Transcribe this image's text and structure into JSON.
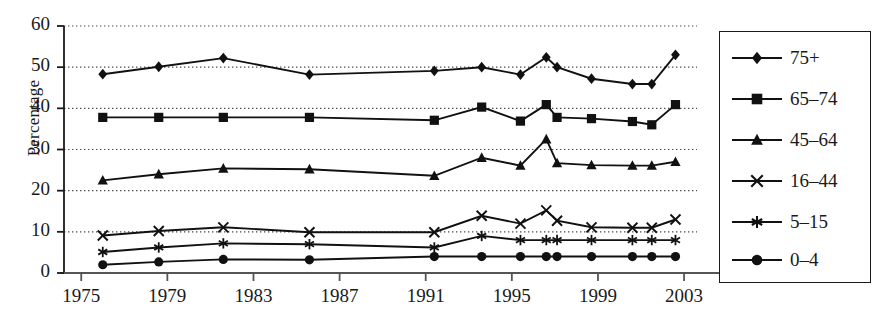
{
  "chart_data": {
    "type": "line",
    "title": "",
    "xlabel": "",
    "ylabel": "Percentage",
    "xlim": [
      1974.2,
      2003.6
    ],
    "ylim": [
      0,
      60
    ],
    "grid": "horizontal-dotted",
    "legend_position": "right-outside",
    "x": [
      1976,
      1978.6,
      1981.6,
      1985.6,
      1991.4,
      1993.6,
      1995.4,
      1996.6,
      1997.1,
      1998.7,
      2000.6,
      2001.5,
      2002.6
    ],
    "xticks": [
      1975,
      1979,
      1983,
      1987,
      1991,
      1995,
      1999,
      2003
    ],
    "xticklabels": [
      "1975",
      "1979",
      "1983",
      "1987",
      "1991",
      "1995",
      "1999",
      "2003"
    ],
    "yticks": [
      0,
      10,
      20,
      30,
      40,
      50,
      60
    ],
    "yticklabels": [
      "0",
      "10",
      "20",
      "30",
      "40",
      "50",
      "60"
    ],
    "series": [
      {
        "name": "75+",
        "marker": "diamond",
        "color": "#111111",
        "values": [
          48.3,
          50.1,
          52.2,
          48.2,
          49.1,
          50.0,
          48.2,
          52.4,
          50.0,
          47.2,
          45.9,
          45.9,
          53.0
        ]
      },
      {
        "name": "65–74",
        "marker": "square",
        "color": "#111111",
        "values": [
          37.8,
          37.8,
          37.8,
          37.8,
          37.1,
          40.3,
          36.9,
          40.9,
          37.8,
          37.5,
          36.8,
          36.0,
          40.9
        ]
      },
      {
        "name": "45–64",
        "marker": "triangle",
        "color": "#111111",
        "values": [
          22.5,
          24.0,
          25.4,
          25.2,
          23.6,
          28.0,
          26.1,
          32.5,
          26.7,
          26.2,
          26.1,
          26.1,
          27.0
        ]
      },
      {
        "name": "16–44",
        "marker": "x",
        "color": "#111111",
        "values": [
          9.1,
          10.2,
          11.1,
          9.9,
          9.9,
          13.9,
          12.0,
          15.2,
          12.7,
          11.1,
          11.0,
          11.0,
          13.0
        ]
      },
      {
        "name": "5–15",
        "marker": "asterisk",
        "color": "#111111",
        "values": [
          5.1,
          6.2,
          7.2,
          7.0,
          6.2,
          9.0,
          8.0,
          8.0,
          8.0,
          8.0,
          8.0,
          8.0,
          8.0
        ]
      },
      {
        "name": "0–4",
        "marker": "circle",
        "color": "#111111",
        "values": [
          2.0,
          2.7,
          3.3,
          3.2,
          4.0,
          4.0,
          4.0,
          4.0,
          4.0,
          4.0,
          4.0,
          4.0,
          4.0
        ]
      }
    ]
  },
  "legend": {
    "entries": [
      "75+",
      "65–74",
      "45–64",
      "16–44",
      "5–15",
      "0–4"
    ]
  }
}
